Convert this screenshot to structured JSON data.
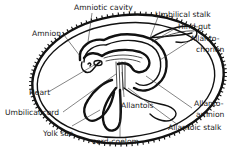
{
  "figure": {
    "labels": {
      "amniotic_cavity": "Amniotic cavity",
      "amnion": "Amnion",
      "umbilical_stalk": "Umbilical stalk",
      "hind_gut": "Hind-gut",
      "allanto_chorion_1": "Allanto-",
      "allanto_chorion_2": "chorion",
      "heart": "Heart",
      "umbilical_cord": "Umbilical cord",
      "yolk_sac": "Yolk sac",
      "allantois": "Allantois",
      "allanto_amnion_1": "Allanto-",
      "allanto_amnion_2": "amnion",
      "allantoic_stalk": "Allantoic stalk",
      "cord_coelom": "cord-coelom"
    },
    "colors": {
      "ink": "#111111",
      "background": "#ffffff"
    }
  }
}
